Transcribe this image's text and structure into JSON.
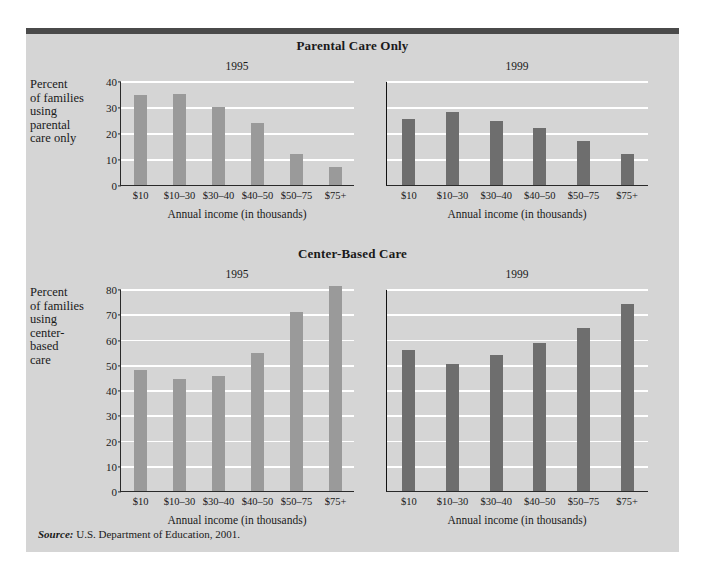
{
  "figure": {
    "source_prefix": "Source:",
    "source_text": " U.S. Department of Education, 2001.",
    "bar_color_1995": "#9a9a9a",
    "bar_color_1999": "#6e6e6e",
    "panel_background": "#d5d5d5",
    "gridline_color": "#ffffff"
  },
  "chart_data": [
    {
      "type": "bar",
      "title": "Parental Care Only",
      "xlabel": "Annual income (in thousands)",
      "ylabel": "Percent of families using parental care only",
      "ylabel_lines": [
        "Percent",
        "of families",
        "using",
        "parental",
        "care only"
      ],
      "categories": [
        "$10",
        "$10–30",
        "$30–40",
        "$40–50",
        "$50–75",
        "$75+"
      ],
      "ylim": [
        0,
        40
      ],
      "yticks": [
        0,
        10,
        20,
        30,
        40
      ],
      "grid": true,
      "legend": "none",
      "panels": [
        {
          "name": "1995",
          "color": "#9a9a9a",
          "values": [
            34.5,
            35,
            30,
            24,
            12,
            7
          ]
        },
        {
          "name": "1999",
          "color": "#6e6e6e",
          "values": [
            25.5,
            28,
            24.5,
            22,
            17,
            12
          ]
        }
      ]
    },
    {
      "type": "bar",
      "title": "Center-Based Care",
      "xlabel": "Annual income (in thousands)",
      "ylabel": "Percent of families using center-based care",
      "ylabel_lines": [
        "Percent",
        "of families",
        "using",
        "center-",
        "based",
        "care"
      ],
      "categories": [
        "$10",
        "$10–30",
        "$30–40",
        "$40–50",
        "$50–75",
        "$75+"
      ],
      "ylim": [
        0,
        80
      ],
      "yticks": [
        0,
        10,
        20,
        30,
        40,
        50,
        60,
        70,
        80
      ],
      "grid": true,
      "legend": "none",
      "panels": [
        {
          "name": "1995",
          "color": "#9a9a9a",
          "values": [
            48,
            44.5,
            45.5,
            54.5,
            71,
            81
          ]
        },
        {
          "name": "1999",
          "color": "#6e6e6e",
          "values": [
            56,
            50.5,
            54,
            58.5,
            64.5,
            74
          ]
        }
      ]
    }
  ]
}
